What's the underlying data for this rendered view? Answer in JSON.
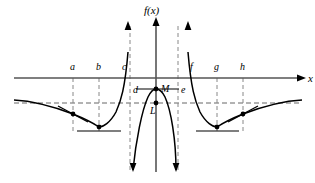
{
  "figure": {
    "background_color": "#ffffff",
    "width": 315,
    "height": 183
  },
  "axes": {
    "y_axis_label": "f(x)",
    "x_axis_label": "x",
    "x_axis_y": 78,
    "y_axis_x": 156,
    "axis_color": "#555555",
    "curve_color": "#000000"
  },
  "tick_labels": [
    {
      "text": "a",
      "x": 70,
      "y": 70
    },
    {
      "text": "b",
      "x": 96,
      "y": 70
    },
    {
      "text": "c",
      "x": 122,
      "y": 70
    },
    {
      "text": "d",
      "x": 133,
      "y": 93
    },
    {
      "text": "e",
      "x": 181,
      "y": 93
    },
    {
      "text": "f",
      "x": 190,
      "y": 70
    },
    {
      "text": "g",
      "x": 214,
      "y": 70
    },
    {
      "text": "h",
      "x": 240,
      "y": 70
    }
  ],
  "point_labels": [
    {
      "text": "M",
      "x": 161,
      "y": 92
    },
    {
      "text": "L",
      "x": 150,
      "y": 114
    }
  ],
  "marked_points": [
    {
      "name": "inflection-left",
      "x": 73,
      "y": 114
    },
    {
      "name": "minimum-left",
      "x": 99,
      "y": 127
    },
    {
      "name": "maximum-center",
      "x": 156,
      "y": 89
    },
    {
      "name": "limit-L",
      "x": 156,
      "y": 103
    },
    {
      "name": "minimum-right",
      "x": 217,
      "y": 127
    },
    {
      "name": "inflection-right",
      "x": 243,
      "y": 114
    }
  ],
  "vertical_asymptotes": [
    {
      "name": "asymptote-d",
      "x": 130
    },
    {
      "name": "asymptote-e",
      "x": 178
    }
  ],
  "horizontal_asymptote": {
    "name": "asymptote-L",
    "y": 103
  },
  "guide_lines": [
    {
      "name": "guide-a",
      "x": 73
    },
    {
      "name": "guide-b",
      "x": 99
    },
    {
      "name": "guide-g",
      "x": 217
    },
    {
      "name": "guide-h",
      "x": 243
    }
  ],
  "tangent_segments": [
    {
      "name": "tangent-inflection-left",
      "x1": 58,
      "y1": 106,
      "x2": 88,
      "y2": 122
    },
    {
      "name": "tangent-minimum-left",
      "x1": 77,
      "y1": 131,
      "x2": 121,
      "y2": 131
    },
    {
      "name": "tangent-maximum-center",
      "x1": 136,
      "y1": 89,
      "x2": 179,
      "y2": 89
    },
    {
      "name": "tangent-minimum-right",
      "x1": 196,
      "y1": 131,
      "x2": 239,
      "y2": 131
    },
    {
      "name": "tangent-inflection-right",
      "x1": 228,
      "y1": 122,
      "x2": 258,
      "y2": 106
    }
  ],
  "curve_paths": {
    "left_branch": "M 14,100 C 34,101 52,106 73,114 C 88,120 96,125 99,127 C 103,127 110,123 116,112 C 121,101 125,88 128,52",
    "center_branch": "M 133,170 C 136,140 142,110 148,97 C 151,91 154,89 156,89 C 159,89 162,91 165,97 C 171,110 176,140 176,170",
    "right_branch": "M 188,52 C 191,88 195,101 200,112 C 206,123 213,127 217,127 C 220,125 228,120 243,114 C 264,106 282,101 302,100"
  }
}
